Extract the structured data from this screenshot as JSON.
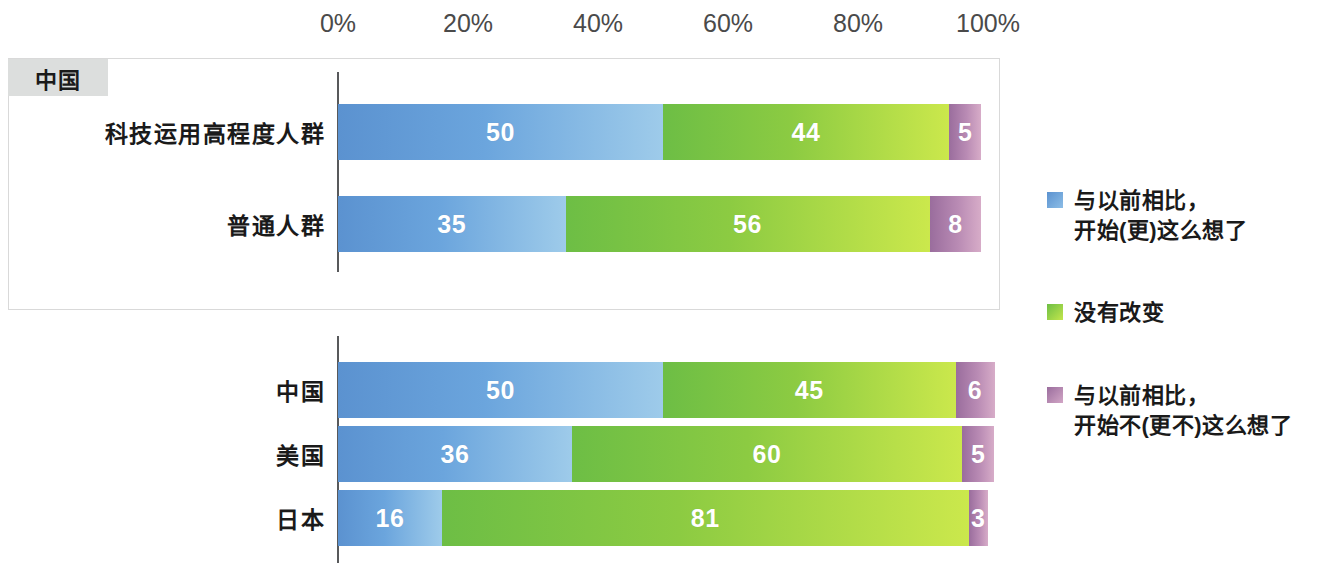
{
  "chart_data": {
    "type": "bar",
    "subtype": "100% stacked horizontal bar",
    "title": "",
    "xlabel": "",
    "ylabel": "",
    "xlim": [
      0,
      100
    ],
    "xticks": [
      0,
      20,
      40,
      60,
      80,
      100
    ],
    "xtick_labels": [
      "0%",
      "20%",
      "40%",
      "60%",
      "80%",
      "100%"
    ],
    "grid": false,
    "legend_position": "right",
    "series": [
      {
        "name": "与以前相比，\n开始(更)这么想了",
        "color": "#5b92d0",
        "gradient_to": "#9ecbea",
        "values": [
          50,
          35,
          50,
          36,
          16
        ]
      },
      {
        "name": "没有改变",
        "color": "#6dbe45",
        "gradient_to": "#cbe84c",
        "values": [
          44,
          56,
          45,
          60,
          81
        ]
      },
      {
        "name": "与以前相比，\n开始不(更不)这么想了",
        "color": "#9a6d9d",
        "gradient_to": "#d7acc8",
        "values": [
          5,
          8,
          6,
          5,
          3
        ]
      }
    ],
    "categories": [
      "科技运用高程度人群",
      "普通人群",
      "中国",
      "美国",
      "日本"
    ],
    "groups": [
      {
        "badge": "中国",
        "boxed": true,
        "rows": [
          {
            "label": "科技运用高程度人群",
            "values": [
              50,
              44,
              5
            ]
          },
          {
            "label": "普通人群",
            "values": [
              35,
              56,
              8
            ]
          }
        ]
      },
      {
        "badge": "",
        "boxed": false,
        "rows": [
          {
            "label": "中国",
            "values": [
              50,
              45,
              6
            ]
          },
          {
            "label": "美国",
            "values": [
              36,
              60,
              5
            ]
          },
          {
            "label": "日本",
            "values": [
              16,
              81,
              3
            ]
          }
        ]
      }
    ]
  },
  "axis": {
    "ticks": [
      {
        "label": "0%",
        "pos": 0
      },
      {
        "label": "20%",
        "pos": 20
      },
      {
        "label": "40%",
        "pos": 40
      },
      {
        "label": "60%",
        "pos": 60
      },
      {
        "label": "80%",
        "pos": 80
      },
      {
        "label": "100%",
        "pos": 100
      }
    ]
  },
  "legend": {
    "items": [
      {
        "swatch": "blue",
        "label": "与以前相比，\n开始(更)这么想了",
        "top": 0
      },
      {
        "swatch": "green",
        "label": "没有改变",
        "top": 112
      },
      {
        "swatch": "purple",
        "label": "与以前相比，\n开始不(更不)这么想了",
        "top": 195
      }
    ]
  },
  "source_note": "",
  "colors": {
    "blue_start": "#5b92d0",
    "blue_end": "#9ecbea",
    "green_start": "#6dbe45",
    "green_end": "#cbe84c",
    "purple_start": "#9a6d9d",
    "purple_end": "#d7acc8",
    "axis_line": "#58595b",
    "badge_bg": "#dcdedd",
    "panel_border": "#d9d9d9",
    "tick_text": "#4a4a4a"
  }
}
